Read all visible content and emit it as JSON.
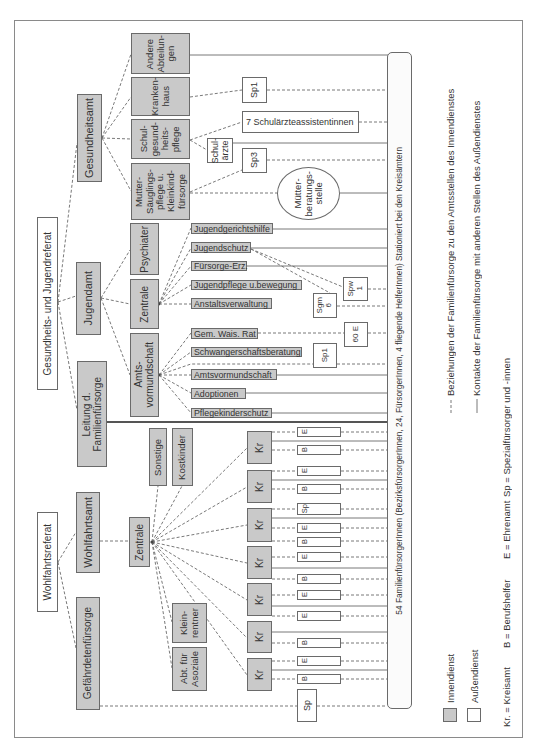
{
  "referate": {
    "gesundheit_jugend": "Gesundheits- und Jugendreferat",
    "wohlfahrt": "Wohlfahrtsreferat"
  },
  "innendienst": {
    "gesundheitsamt": "Gesundheitsamt",
    "jugendamt": "Jugendamt",
    "leitung": "Leitung d.\nFamilienfürsorge",
    "wohlfahrtsamt": "Wohlfahrtsamt",
    "gefaehrdetenfuersorge": "Gefährdetenfürsorge",
    "gesundheitsamt_abteilungen": [
      "Andere\nAbteilun-\ngen",
      "Kranken-\nhaus",
      "Schul-\ngesund-\nheits-\npflege",
      "Mutter-\nSäuglings-\npflege u.\nKleinkind-\nfürsorge"
    ],
    "jugendamt_abteilungen": [
      "Psychiater",
      "Zentrale",
      "Amts-\nvormundschaft"
    ],
    "jugendamt_stellen": [
      "Jugendgerichtshilfe",
      "Jugendschutz",
      "Fürsorge-Erz.",
      "Jugendpflege u.bewegung",
      "Anstaltsverwaltung",
      "Gem. Wais. Rat",
      "Schwangerschaftsberatung",
      "Amtsvormundschaft",
      "Adoptionen",
      "Pflegekinderschutz"
    ],
    "wohlfahrtsamt_abteilungen": {
      "zentrale": "Zentrale",
      "sonstige": "Sonstige",
      "kostkinder": "Kostkinder",
      "kleinrentner": "Klein-\nrentner",
      "asoziale": "Abt. für\nAsoziale"
    },
    "kreisaemter": [
      "Kr",
      "Kr",
      "Kr",
      "Kr",
      "Kr",
      "Kr",
      "Kr"
    ]
  },
  "aussendienst": {
    "sp1_gesundheit": "Sp1",
    "schulaerzteassistentinnen": "7 Schulärzteassistentinnen",
    "schulaerzte": "Schul-\närzte",
    "sp3": "Sp3",
    "muetterberatungsstelle": "Mütter-\nberatungs-\nstelle",
    "spw": "Spw\n1",
    "sgm": "Sgm\n6",
    "ehrenamt_60": "60 E",
    "sp1_jugend": "Sp1",
    "helfer": [
      "E",
      "B",
      "E",
      "B",
      "Sp",
      "E",
      "B",
      "E",
      "B",
      "E",
      "E",
      "B",
      "E",
      "B"
    ],
    "sp_gefaehrdete": "Sp"
  },
  "familienfuersorge_bar": "54 FamilienfürsorgerInnen (BezirksfürsorgerInnen, 24, FürsorgerInnen, 4 fliegende HelferInnen) Stationiert bei den Kreisämtern",
  "legend": {
    "dashed": "Beziehungen der Familienfürsorge zu den Amtsstellen des Innendienstes",
    "solid": "Kontakte der Familienfürsorge mit anderen Stellen des Außendienstes",
    "innendienst": "Innendienst",
    "aussendienst": "Außendienst",
    "abbreviations": [
      "Kr. = Kreisamt",
      "B = Berufshelfer",
      "E = Ehrenamt",
      "Sp = Spezialfürsorger und -innen"
    ]
  },
  "colors": {
    "innendienst": "#c9c9c9",
    "aussendienst": "#ffffff",
    "line": "#6a6a6a",
    "text": "#333333"
  }
}
